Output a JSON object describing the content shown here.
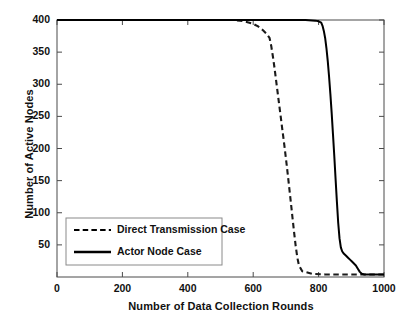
{
  "chart_data": {
    "type": "line",
    "title": "",
    "xlabel": "Number of Data Collection Rounds",
    "ylabel": "Number of Active Nodes",
    "xlim": [
      0,
      1000
    ],
    "ylim": [
      0,
      400
    ],
    "xticks": [
      0,
      200,
      400,
      600,
      800,
      1000
    ],
    "xtick_labels": [
      "0",
      "200",
      "400",
      "600",
      "800",
      "1000"
    ],
    "yticks": [
      50,
      100,
      150,
      200,
      250,
      300,
      350,
      400
    ],
    "ytick_labels": [
      "50",
      "100",
      "150",
      "200",
      "250",
      "300",
      "350",
      "400"
    ],
    "grid": false,
    "legend_position": "lower-left-inside",
    "series": [
      {
        "name": "Direct Transmission Case",
        "style": "dashed",
        "color": "#1a1a1a",
        "x": [
          0,
          100,
          200,
          300,
          400,
          500,
          540,
          560,
          580,
          600,
          615,
          630,
          640,
          650,
          655,
          660,
          665,
          670,
          675,
          680,
          685,
          690,
          695,
          700,
          705,
          710,
          715,
          720,
          725,
          730,
          735,
          740,
          750,
          780,
          820,
          860,
          900,
          950,
          1000
        ],
        "y": [
          400,
          400,
          400,
          400,
          400,
          400,
          400,
          399,
          397,
          394,
          390,
          384,
          379,
          372,
          360,
          344,
          326,
          306,
          286,
          266,
          246,
          226,
          206,
          185,
          163,
          140,
          117,
          93,
          70,
          48,
          30,
          18,
          9,
          5,
          4,
          4,
          4,
          4,
          4
        ]
      },
      {
        "name": "Actor Node Case",
        "style": "solid",
        "color": "#000000",
        "x": [
          0,
          100,
          200,
          300,
          400,
          500,
          600,
          700,
          760,
          790,
          800,
          808,
          812,
          816,
          820,
          824,
          828,
          832,
          836,
          840,
          844,
          848,
          852,
          856,
          860,
          864,
          868,
          872,
          876,
          880,
          884,
          890,
          896,
          902,
          908,
          914,
          920,
          926,
          932,
          940,
          960,
          1000
        ],
        "y": [
          400,
          400,
          400,
          400,
          400,
          400,
          400,
          400,
          400,
          399,
          398,
          396,
          391,
          383,
          372,
          356,
          336,
          312,
          285,
          255,
          222,
          188,
          152,
          117,
          84,
          60,
          46,
          40,
          37,
          35,
          33,
          30,
          27,
          24,
          21,
          18,
          13,
          8,
          5,
          4,
          4,
          4
        ]
      }
    ]
  },
  "legend": {
    "items": [
      {
        "label": "Direct Transmission Case",
        "style": "dashed"
      },
      {
        "label": "Actor Node Case",
        "style": "solid"
      }
    ]
  }
}
